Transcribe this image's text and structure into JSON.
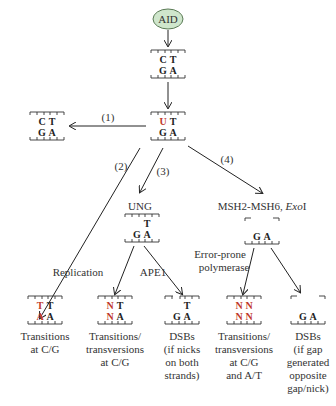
{
  "start": {
    "label": "AID",
    "fill": "#cfe6cc",
    "stroke": "#5a7a55"
  },
  "colors": {
    "mutation": "#c0392b",
    "text": "#333333"
  },
  "dna": {
    "initial": {
      "top": [
        "C",
        "T"
      ],
      "bottom": [
        "G",
        "A"
      ]
    },
    "deaminated": {
      "top": [
        "U",
        "T"
      ],
      "bottom": [
        "G",
        "A"
      ]
    },
    "repaired": {
      "top": [
        "C",
        "T"
      ],
      "bottom": [
        "G",
        "A"
      ]
    },
    "ung_abasic": {
      "top": [
        "",
        "T"
      ],
      "bottom": [
        "G",
        "A"
      ]
    },
    "msh_gap": {
      "top": [
        "",
        ""
      ],
      "bottom": [
        "G",
        "A"
      ]
    },
    "out_transition": {
      "top": [
        "T",
        "T"
      ],
      "bottom": [
        "A",
        "A"
      ]
    },
    "out_replication": {
      "top": [
        "N",
        "T"
      ],
      "bottom": [
        "N",
        "A"
      ]
    },
    "out_ape1": {
      "top": [
        "",
        "T"
      ],
      "bottom": [
        "G",
        "A"
      ]
    },
    "out_errorprone": {
      "top": [
        "N",
        "N"
      ],
      "bottom": [
        "N",
        "N"
      ]
    },
    "out_gap": {
      "top": [
        "",
        ""
      ],
      "bottom": [
        "G",
        "A"
      ]
    }
  },
  "pathways": {
    "p1": "(1)",
    "p2": "(2)",
    "p3": "(3)",
    "p4": "(4)"
  },
  "labels": {
    "ung": "UNG",
    "msh": "MSH2-MSH6, ",
    "exo": "Exo",
    "exo_suffix": "I",
    "replication": "Replication",
    "ape1": "APE1",
    "errorprone_1": "Error-prone",
    "errorprone_2": "polymerase"
  },
  "outcomes": [
    {
      "lines": [
        "Transitions",
        "at C/G"
      ]
    },
    {
      "lines": [
        "Transitions/",
        "transversions",
        "at C/G"
      ]
    },
    {
      "lines": [
        "DSBs",
        "(if nicks",
        "on both",
        "strands)"
      ]
    },
    {
      "lines": [
        "Transitions/",
        "transversions",
        "at C/G",
        "and A/T"
      ]
    },
    {
      "lines": [
        "DSBs",
        "(if gap",
        "generated",
        "opposite",
        "gap/nick)"
      ]
    }
  ]
}
